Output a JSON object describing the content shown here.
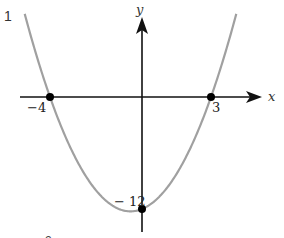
{
  "problem_number": "1",
  "next_problem_number_partial": "2",
  "axes": {
    "x_label": "x",
    "y_label": "y"
  },
  "points": [
    {
      "name": "x-intercept-left",
      "label": "−4",
      "x": -4,
      "y": 0
    },
    {
      "name": "x-intercept-right",
      "label": "3",
      "x": 3,
      "y": 0
    },
    {
      "name": "y-intercept",
      "label": "− 12",
      "x": 0,
      "y": -12
    }
  ],
  "curve": {
    "type": "parabola",
    "equation": "y = (x + 4)(x − 3)",
    "color": "#a0a0a0"
  },
  "colors": {
    "axis": "#111111",
    "curve": "#a0a0a0",
    "point": "#000000",
    "text": "#222222"
  },
  "chart_data": {
    "type": "line",
    "title": "",
    "xlabel": "x",
    "ylabel": "y",
    "series": [
      {
        "name": "y = x^2 + x - 12",
        "x": [
          -5.09,
          -4,
          -3,
          -2,
          -1,
          -0.5,
          0,
          1,
          2,
          3,
          4.09
        ],
        "values": [
          8.8,
          0,
          -6,
          -10,
          -12,
          -12.25,
          -12,
          -10,
          -6,
          0,
          8.8
        ]
      }
    ],
    "annotations": [
      "-4",
      "3",
      "-12"
    ],
    "grid": false
  }
}
